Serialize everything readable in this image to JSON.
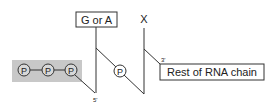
{
  "diagram": {
    "base_box": "G or A",
    "x_label": "X",
    "phosphates": [
      "P",
      "P",
      "P"
    ],
    "bridge_phosphate": "P",
    "five_prime": "5'",
    "three_prime": "3'",
    "rna_box": "Rest of RNA chain",
    "colors": {
      "stroke": "#333333",
      "highlight": "#c8c8c8",
      "text": "#222222"
    }
  }
}
